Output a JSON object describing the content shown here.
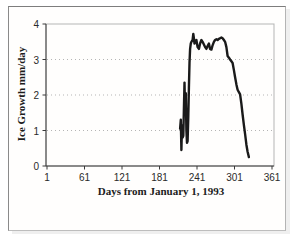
{
  "chart_data": {
    "type": "line",
    "title": "",
    "xlabel": "Days from January 1, 1993",
    "ylabel": "Ice Growth mm/day",
    "x_ticks": [
      1,
      61,
      121,
      181,
      241,
      301,
      361
    ],
    "y_ticks": [
      0,
      1,
      2,
      3,
      4
    ],
    "xlim": [
      1,
      361
    ],
    "ylim": [
      0,
      4
    ],
    "gridlines_y": [
      1,
      2,
      3
    ],
    "grid_style": "dotted",
    "legend": "none",
    "line_color": "#1a1a1a",
    "axis_color": "#3a3a3a",
    "plot_border_color": "#b5b5b5",
    "series": [
      {
        "name": "Ice Growth",
        "points": [
          [
            214,
            1.05
          ],
          [
            215,
            1.3
          ],
          [
            216,
            0.45
          ],
          [
            217,
            1.15
          ],
          [
            218,
            0.8
          ],
          [
            219,
            0.85
          ],
          [
            221,
            2.35
          ],
          [
            222,
            1.5
          ],
          [
            223,
            2.05
          ],
          [
            224,
            1.0
          ],
          [
            225,
            0.65
          ],
          [
            226,
            0.7
          ],
          [
            227,
            1.4
          ],
          [
            228,
            2.2
          ],
          [
            229,
            2.9
          ],
          [
            230,
            3.3
          ],
          [
            231,
            3.45
          ],
          [
            232,
            3.5
          ],
          [
            234,
            3.55
          ],
          [
            235,
            3.72
          ],
          [
            236,
            3.6
          ],
          [
            237,
            3.45
          ],
          [
            238,
            3.5
          ],
          [
            240,
            3.55
          ],
          [
            242,
            3.35
          ],
          [
            244,
            3.3
          ],
          [
            246,
            3.45
          ],
          [
            248,
            3.55
          ],
          [
            250,
            3.5
          ],
          [
            252,
            3.42
          ],
          [
            254,
            3.35
          ],
          [
            256,
            3.3
          ],
          [
            258,
            3.38
          ],
          [
            260,
            3.45
          ],
          [
            262,
            3.3
          ],
          [
            264,
            3.28
          ],
          [
            266,
            3.4
          ],
          [
            268,
            3.5
          ],
          [
            270,
            3.55
          ],
          [
            272,
            3.57
          ],
          [
            274,
            3.55
          ],
          [
            276,
            3.58
          ],
          [
            278,
            3.6
          ],
          [
            280,
            3.62
          ],
          [
            282,
            3.6
          ],
          [
            284,
            3.55
          ],
          [
            286,
            3.5
          ],
          [
            288,
            3.35
          ],
          [
            290,
            3.1
          ],
          [
            292,
            3.05
          ],
          [
            294,
            3.0
          ],
          [
            296,
            2.95
          ],
          [
            298,
            2.9
          ],
          [
            300,
            2.7
          ],
          [
            302,
            2.5
          ],
          [
            304,
            2.3
          ],
          [
            306,
            2.15
          ],
          [
            308,
            2.08
          ],
          [
            310,
            2.02
          ],
          [
            312,
            1.75
          ],
          [
            314,
            1.45
          ],
          [
            316,
            1.15
          ],
          [
            318,
            0.9
          ],
          [
            320,
            0.6
          ],
          [
            322,
            0.4
          ],
          [
            324,
            0.25
          ]
        ]
      }
    ]
  }
}
